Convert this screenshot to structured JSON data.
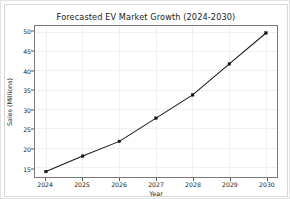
{
  "chart_data": {
    "type": "line",
    "title": "Forecasted EV Market Growth (2024-2030)",
    "xlabel": "Year",
    "ylabel": "Sales (Millions)",
    "categories": [
      "2024",
      "2025",
      "2026",
      "2027",
      "2028",
      "2029",
      "2030"
    ],
    "x": [
      2024,
      2025,
      2026,
      2027,
      2028,
      2029,
      2030
    ],
    "values": [
      14.0,
      18.0,
      21.8,
      27.8,
      33.8,
      41.8,
      49.8
    ],
    "series": [
      {
        "name": "Sales (Millions)",
        "values": [
          14.0,
          18.0,
          21.8,
          27.8,
          33.8,
          41.8,
          49.8
        ]
      }
    ],
    "xtick_labels": [
      "2024",
      "2025",
      "2026",
      "2027",
      "2028",
      "2029",
      "2030"
    ],
    "ytick_labels": [
      "15",
      "20",
      "25",
      "30",
      "35",
      "40",
      "45",
      "50"
    ],
    "yticks": [
      15,
      20,
      25,
      30,
      35,
      40,
      45,
      50
    ],
    "xlim": [
      2023.7,
      2030.3
    ],
    "ylim": [
      12.6,
      51.6
    ],
    "grid": true,
    "legend": "none",
    "marker": "square",
    "line_color": "#1c1c1c",
    "marker_color": "#111111",
    "grid_color": "#f0f0f0",
    "background_color": "#ffffff"
  }
}
